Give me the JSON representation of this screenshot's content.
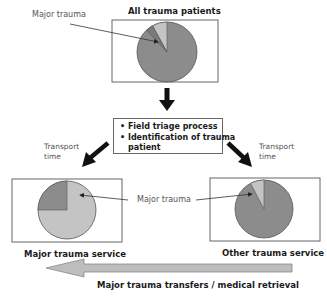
{
  "top": {
    "title": "All trauma patients",
    "callout": "Major trauma",
    "pie": {
      "major_pct": 10,
      "other_pct": 90
    }
  },
  "triage": {
    "items": [
      "Field triage process",
      "Identification of trauma",
      "patient"
    ]
  },
  "left": {
    "transport_line1": "Transport",
    "transport_line2": "time",
    "caption": "Major trauma service",
    "pie": {
      "major_pct": 75,
      "other_pct": 25
    }
  },
  "right": {
    "transport_line1": "Transport",
    "transport_line2": "time",
    "caption": "Other trauma service",
    "pie": {
      "major_pct": 8,
      "other_pct": 92
    }
  },
  "middle_callout": "Major trauma",
  "bottom_arrow": {
    "label": "Major trauma transfers / medical retrieval"
  },
  "colors": {
    "major_slice": "#c4c4c4",
    "other_slice": "#8c8c8c",
    "wedge_dark": "#7a7a7a",
    "arrow": "#111111",
    "transfer_arrow": "#bdbdbd"
  }
}
